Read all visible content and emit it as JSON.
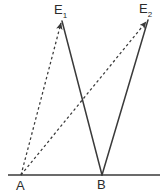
{
  "figure": {
    "type": "geometric-diagram",
    "background_color": "#ffffff",
    "stroke_color": "#3a3a3a",
    "baseline": {
      "name": "baseline-AB",
      "x1": 8,
      "y1": 175,
      "x2": 160,
      "y2": 175,
      "style": "solid",
      "width": 1.6
    },
    "points": [
      {
        "id": "A",
        "label": "A",
        "x": 21,
        "y": 175,
        "label_x": 16,
        "label_y": 179
      },
      {
        "id": "B",
        "label": "B",
        "x": 102,
        "y": 175,
        "label_x": 97,
        "label_y": 178
      },
      {
        "id": "E1",
        "label": "E",
        "sub": "1",
        "x": 62,
        "y": 21,
        "label_x": 54,
        "label_y": 3
      },
      {
        "id": "E2",
        "label": "E",
        "sub": "2",
        "x": 148,
        "y": 20,
        "label_x": 139,
        "label_y": 2
      }
    ],
    "segments": [
      {
        "name": "segment-A-to-E1",
        "from": "A",
        "to": "E1",
        "style": "dashed",
        "arrow": "end",
        "x1": 21,
        "y1": 175,
        "x2": 62,
        "y2": 21
      },
      {
        "name": "segment-A-to-E2",
        "from": "A",
        "to": "E2",
        "style": "dashed",
        "arrow": "end",
        "x1": 21,
        "y1": 175,
        "x2": 148,
        "y2": 20
      },
      {
        "name": "segment-E1-to-B",
        "from": "E1",
        "to": "B",
        "style": "solid",
        "arrow": "none",
        "x1": 62,
        "y1": 21,
        "x2": 102,
        "y2": 175
      },
      {
        "name": "segment-B-to-E2",
        "from": "B",
        "to": "E2",
        "style": "solid",
        "arrow": "none",
        "x1": 102,
        "y1": 175,
        "x2": 148,
        "y2": 20
      }
    ],
    "labels": {
      "e1_main": "E",
      "e1_sub": "1",
      "e2_main": "E",
      "e2_sub": "2",
      "a": "A",
      "b": "B"
    }
  }
}
